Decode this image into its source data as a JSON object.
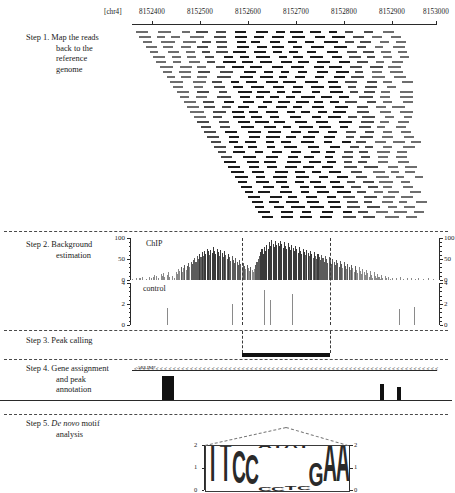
{
  "figure": {
    "chromosome": "[chr4]"
  },
  "coordinate_axis": {
    "chrom_label": "[chr4]",
    "ticks": [
      {
        "label": "8152400",
        "x": 152
      },
      {
        "label": "8152500",
        "x": 200
      },
      {
        "label": "8152600",
        "x": 248
      },
      {
        "label": "8152700",
        "x": 296
      },
      {
        "label": "8152800",
        "x": 344
      },
      {
        "label": "8152900",
        "x": 392
      },
      {
        "label": "8153000",
        "x": 436
      }
    ]
  },
  "steps": [
    {
      "number": "Step 1.",
      "line1": "Map the reads",
      "line2": "back to the",
      "line3": "reference",
      "line4": "genome"
    },
    {
      "number": "Step 2.",
      "line1": "Background",
      "line2": "estimation"
    },
    {
      "number": "Step 3.",
      "line1": "Peak calling"
    },
    {
      "number": "Step 4.",
      "line1": "Gene assignment",
      "line2": "and peak",
      "line3": "annotation"
    },
    {
      "number": "Step 5.",
      "line1": "De novo motif",
      "line2": "analysis",
      "italic": "De novo"
    }
  ],
  "step2": {
    "chip_track_label": "ChIP",
    "control_track_label": "control",
    "chip_axis": {
      "labels": [
        "100",
        "50",
        "0"
      ],
      "min": 0,
      "max": 100
    },
    "control_axis": {
      "labels": [
        "4",
        "2",
        "0"
      ],
      "min": 0,
      "max": 4
    }
  },
  "step4": {
    "gene_name": "ARLIM7"
  },
  "step5": {
    "motif_axis_left": [
      "2",
      "1",
      "0"
    ],
    "motif_axis_right": [
      "2",
      "1",
      "0"
    ],
    "motif_consensus": "TTCC..GAA",
    "logo_letters": [
      {
        "letters": [
          "T"
        ],
        "heights": [
          1.95
        ]
      },
      {
        "letters": [
          "T"
        ],
        "heights": [
          1.9
        ]
      },
      {
        "letters": [
          "C"
        ],
        "heights": [
          1.45
        ]
      },
      {
        "letters": [
          "C"
        ],
        "heights": [
          1.35
        ]
      },
      {
        "letters": [
          "T",
          "A",
          "C"
        ],
        "heights": [
          0.35,
          0.22,
          0.15
        ]
      },
      {
        "letters": [
          "A",
          "T",
          "C"
        ],
        "heights": [
          0.3,
          0.2,
          0.14
        ]
      },
      {
        "letters": [
          "A",
          "T"
        ],
        "heights": [
          0.28,
          0.18
        ]
      },
      {
        "letters": [
          "T",
          "C"
        ],
        "heights": [
          0.32,
          0.18
        ]
      },
      {
        "letters": [
          "G"
        ],
        "heights": [
          1.05
        ]
      },
      {
        "letters": [
          "A"
        ],
        "heights": [
          1.8
        ]
      },
      {
        "letters": [
          "A"
        ],
        "heights": [
          1.88
        ]
      }
    ]
  },
  "chart_data": {
    "type": "bar",
    "xlabel": "Genomic coordinate (chr4)",
    "panels": [
      {
        "name": "ChIP",
        "ylabel": "ChIP",
        "ylim": [
          0,
          100
        ],
        "yticks": [
          0,
          50,
          100
        ],
        "x_start": 8152350,
        "x_end": 8153030,
        "values": [
          3,
          0,
          0,
          5,
          0,
          0,
          4,
          0,
          6,
          0,
          0,
          3,
          0,
          0,
          8,
          5,
          0,
          6,
          12,
          9,
          0,
          4,
          0,
          14,
          10,
          16,
          8,
          0,
          11,
          18,
          6,
          0,
          9,
          0,
          4,
          20,
          15,
          26,
          22,
          31,
          19,
          28,
          36,
          24,
          33,
          41,
          30,
          44,
          38,
          47,
          52,
          43,
          56,
          49,
          61,
          54,
          66,
          58,
          70,
          63,
          74,
          68,
          59,
          72,
          65,
          78,
          69,
          62,
          75,
          67,
          58,
          71,
          64,
          55,
          68,
          60,
          50,
          62,
          54,
          45,
          57,
          48,
          40,
          52,
          43,
          36,
          47,
          38,
          30,
          41,
          33,
          26,
          36,
          28,
          22,
          31,
          24,
          18,
          27,
          35,
          42,
          50,
          58,
          66,
          73,
          61,
          78,
          69,
          84,
          75,
          90,
          81,
          95,
          86,
          79,
          92,
          83,
          88,
          80,
          94,
          85,
          77,
          90,
          82,
          74,
          87,
          79,
          71,
          84,
          76,
          68,
          81,
          73,
          65,
          78,
          70,
          62,
          75,
          67,
          59,
          72,
          64,
          56,
          69,
          61,
          53,
          66,
          58,
          50,
          63,
          55,
          47,
          60,
          52,
          44,
          57,
          49,
          41,
          54,
          46,
          38,
          51,
          43,
          35,
          48,
          40,
          32,
          45,
          37,
          29,
          42,
          34,
          26,
          39,
          31,
          23,
          36,
          28,
          20,
          33,
          25,
          17,
          30,
          22,
          14,
          27,
          19,
          11,
          24,
          16,
          8,
          21,
          13,
          5,
          18,
          10,
          4,
          15,
          7,
          3,
          12,
          5,
          0,
          9,
          4,
          0,
          7,
          3,
          0,
          5,
          0,
          0,
          4,
          0,
          0,
          6,
          0,
          0,
          3,
          0,
          0,
          5,
          0,
          0,
          4,
          0,
          0,
          3,
          0,
          0,
          4,
          0,
          0,
          0,
          3,
          0,
          0,
          0,
          4,
          0,
          0,
          0,
          3,
          0,
          0
        ]
      },
      {
        "name": "control",
        "ylabel": "control",
        "ylim": [
          0,
          4
        ],
        "yticks": [
          0,
          2,
          4
        ],
        "x_start": 8152350,
        "x_end": 8153030,
        "values": [
          0,
          0,
          0,
          0,
          0,
          0,
          0,
          0,
          0,
          0,
          0,
          0,
          0,
          0,
          0,
          0,
          0,
          0,
          0,
          0,
          0,
          0,
          0,
          0,
          0,
          0,
          0,
          0,
          0,
          1.6,
          0,
          0,
          0,
          0,
          0,
          0,
          0,
          0,
          0,
          0,
          0,
          0,
          0,
          0,
          0,
          0,
          0,
          0,
          0,
          0,
          0,
          0,
          0,
          0,
          0,
          0,
          0,
          0,
          0,
          0,
          0,
          0,
          0,
          0,
          0,
          0,
          0,
          0,
          0,
          0,
          0,
          0,
          0,
          0,
          0,
          0,
          0,
          0,
          0,
          0,
          0,
          0,
          0,
          2.0,
          0,
          0,
          0,
          0,
          0,
          0,
          0,
          0,
          0,
          0,
          0,
          0,
          0,
          0,
          0,
          0,
          0,
          0,
          0,
          0,
          0,
          0,
          0,
          0,
          0,
          3.3,
          0,
          0,
          0,
          0,
          2.4,
          0,
          0,
          0,
          0,
          0,
          0,
          0,
          0,
          0,
          0,
          0,
          0,
          0,
          0,
          0,
          0,
          0,
          3.0,
          0,
          0,
          0,
          0,
          0,
          0,
          0,
          0,
          0,
          0,
          0,
          0,
          0,
          0,
          0,
          0,
          0,
          0,
          0,
          0,
          0,
          0,
          0,
          0,
          0,
          0,
          0,
          0,
          0,
          0,
          0,
          0,
          0,
          0,
          0,
          0,
          0,
          0,
          0,
          0,
          0,
          0,
          0,
          0,
          0,
          0,
          0,
          0,
          0,
          0,
          0,
          0,
          0,
          0,
          0,
          0,
          0,
          0,
          0,
          0,
          0,
          0,
          0,
          0,
          0,
          0,
          0,
          0,
          0,
          0,
          0,
          0,
          0,
          0,
          0,
          0,
          0,
          0,
          0,
          0,
          0,
          0,
          0,
          0,
          0,
          0,
          0,
          0,
          1.5,
          0,
          0,
          0,
          0,
          0,
          0,
          0,
          0,
          0,
          0,
          0,
          1.7,
          0,
          0,
          0,
          0,
          0,
          0,
          0,
          0,
          0,
          0,
          0,
          0,
          0,
          0,
          0,
          0,
          0,
          0
        ]
      }
    ],
    "peak_region": {
      "start_px": 242,
      "end_px": 330,
      "label": "called peak"
    },
    "legend": [
      "ChIP",
      "control"
    ],
    "grid": false
  }
}
